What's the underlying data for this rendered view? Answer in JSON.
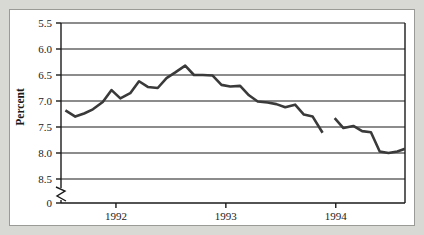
{
  "figure": {
    "background_color": "#d8d8d4",
    "panel_color": "#ffffff",
    "panel_border_color": "#9a9a96",
    "axis_color": "#1a1a1a",
    "grid_color": "#1a1a1a",
    "line_color": "#3a3a3a"
  },
  "labels": {
    "ylabel": "Percent",
    "y_ticks": [
      "8.5",
      "8.0",
      "7.5",
      "7.0",
      "6.5",
      "6.0",
      "5.5",
      "0"
    ],
    "x_ticks": [
      "1992",
      "1993",
      "1994"
    ],
    "axis_break_symbol": "axis-break"
  },
  "chart_data": {
    "type": "line",
    "title": "",
    "xlabel": "",
    "ylabel": "Percent",
    "ylim": [
      5.5,
      8.5
    ],
    "y_ticks": [
      5.5,
      6.0,
      6.5,
      7.0,
      7.5,
      8.0,
      8.5
    ],
    "y_axis_break": true,
    "y_axis_break_label": "0",
    "grid": true,
    "grid_orientation": "horizontal",
    "legend": "none",
    "xlim": [
      1991.5,
      1994.63
    ],
    "x_ticks": [
      1992,
      1993,
      1994
    ],
    "x_tick_labels": [
      "1992",
      "1993",
      "1994"
    ],
    "series": [
      {
        "name": "Unemployment rate",
        "color": "#3a3a3a",
        "segments": [
          {
            "x": [
              1991.54,
              1991.63,
              1991.71,
              1991.79,
              1991.88,
              1991.96,
              1992.04,
              1992.13,
              1992.21,
              1992.29,
              1992.38,
              1992.46,
              1992.54,
              1992.63,
              1992.71,
              1992.79,
              1992.88,
              1992.96,
              1993.04,
              1993.13,
              1993.21,
              1993.29,
              1993.38,
              1993.46,
              1993.54,
              1993.63,
              1993.71,
              1993.79,
              1993.88
            ],
            "y": [
              6.82,
              6.7,
              6.76,
              6.84,
              6.98,
              7.21,
              7.05,
              7.15,
              7.38,
              7.27,
              7.25,
              7.44,
              7.55,
              7.68,
              7.5,
              7.5,
              7.49,
              7.31,
              7.28,
              7.29,
              7.11,
              6.99,
              6.97,
              6.94,
              6.88,
              6.93,
              6.74,
              6.7,
              6.39
            ]
          },
          {
            "x": [
              1993.99,
              1994.07,
              1994.16,
              1994.24,
              1994.32,
              1994.4,
              1994.48,
              1994.56,
              1994.63
            ],
            "y": [
              6.67,
              6.48,
              6.52,
              6.42,
              6.4,
              6.03,
              6.0,
              6.03,
              6.08
            ]
          }
        ]
      }
    ]
  }
}
